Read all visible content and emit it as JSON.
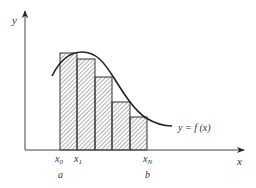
{
  "diagram": {
    "axes": {
      "x_label": "x",
      "y_label": "y"
    },
    "curve_label": "y = f (x)",
    "partition_labels": {
      "x0": "x",
      "x0_sub": "0",
      "x1": "x",
      "x1_sub": "1",
      "xN": "x",
      "xN_sub": "N"
    },
    "bound_labels": {
      "a": "a",
      "b": "b"
    },
    "rectangles": [
      {
        "x_left": 60,
        "x_right": 77,
        "top": 53
      },
      {
        "x_left": 77,
        "x_right": 95,
        "top": 59
      },
      {
        "x_left": 95,
        "x_right": 112,
        "top": 77
      },
      {
        "x_left": 112,
        "x_right": 130,
        "top": 102
      },
      {
        "x_left": 130,
        "x_right": 147,
        "top": 117
      }
    ],
    "colors": {
      "stroke": "#333333",
      "hatch": "#555555",
      "background": "#ffffff"
    }
  }
}
